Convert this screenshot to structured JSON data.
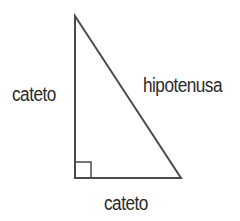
{
  "diagram": {
    "type": "right-triangle",
    "labels": {
      "left_leg": "cateto",
      "hypotenuse": "hipotenusa",
      "bottom_leg": "cateto"
    },
    "colors": {
      "stroke": "#4a4a4a",
      "text": "#2a2a2a",
      "background": "#ffffff"
    }
  }
}
